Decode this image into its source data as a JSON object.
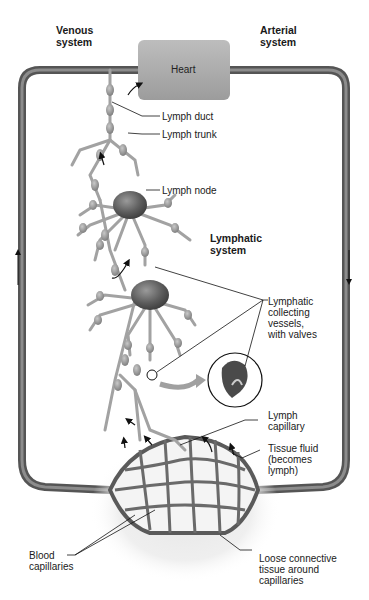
{
  "diagram": {
    "title_left": "Venous\nsystem",
    "title_right": "Arterial\nsystem",
    "heart": "Heart",
    "lymphatic_system": "Lymphatic\nsystem",
    "labels": {
      "lymph_duct": "Lymph duct",
      "lymph_trunk": "Lymph trunk",
      "lymph_node": "Lymph node",
      "collecting_vessels": "Lymphatic\ncollecting\nvessels,\nwith valves",
      "lymph_capillary": "Lymph\ncapillary",
      "tissue_fluid": "Tissue fluid\n(becomes\nlymph)",
      "blood_capillaries": "Blood\ncapillaries",
      "loose_tissue": "Loose connective\ntissue around\ncapillaries"
    },
    "flow_arrows": {
      "left": "up",
      "right": "down"
    },
    "colors": {
      "vessel": "#6e6e6e",
      "heart": "#a9a9a9",
      "node": "#5a5a5a",
      "lymph_vessel": "#9a9a9a",
      "highlight_arrow": "#a0a0a0"
    }
  }
}
